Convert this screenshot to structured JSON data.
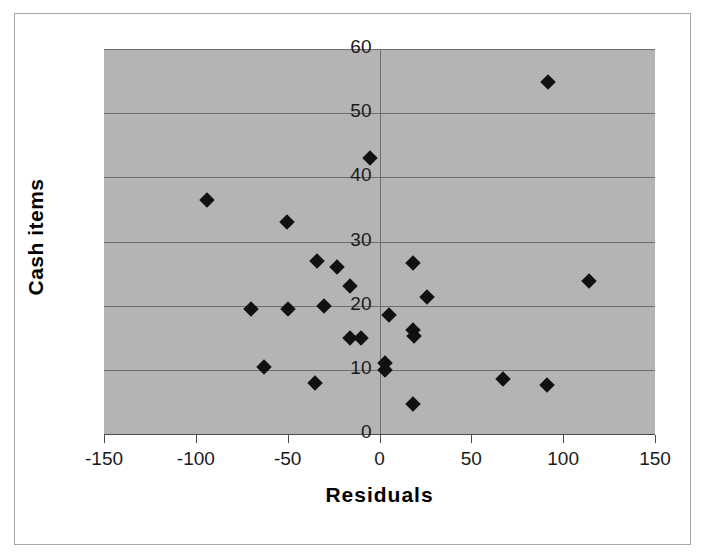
{
  "chart_data": {
    "type": "scatter",
    "title": "",
    "xlabel": "Residuals",
    "ylabel": "Cash items",
    "xlim": [
      -150,
      150
    ],
    "ylim": [
      0,
      60
    ],
    "xticks": [
      -150,
      -100,
      -50,
      0,
      50,
      100,
      150
    ],
    "yticks": [
      0,
      10,
      20,
      30,
      40,
      50,
      60
    ],
    "xtick_labels": [
      "-150",
      "-100",
      "-50",
      "0",
      "50",
      "100",
      "150"
    ],
    "ytick_labels": [
      "0",
      "10",
      "20",
      "30",
      "40",
      "50",
      "60"
    ],
    "grid": "horizontal-and-zero-vertical",
    "legend": "none",
    "plot_background": "#b4b4b4",
    "marker_color": "#111111",
    "marker_shape": "diamond",
    "series": [
      {
        "name": "Cash items vs Residuals",
        "points": [
          {
            "x": -94,
            "y": 36.4
          },
          {
            "x": -70,
            "y": 19.5
          },
          {
            "x": -63,
            "y": 10.5
          },
          {
            "x": -50.5,
            "y": 33.0
          },
          {
            "x": -50,
            "y": 19.5
          },
          {
            "x": -35,
            "y": 8.0
          },
          {
            "x": -34,
            "y": 27.0
          },
          {
            "x": -30,
            "y": 20.0
          },
          {
            "x": -23,
            "y": 26.0
          },
          {
            "x": -16,
            "y": 23.0
          },
          {
            "x": -16,
            "y": 15.0
          },
          {
            "x": -10,
            "y": 15.0
          },
          {
            "x": -5,
            "y": 43.0
          },
          {
            "x": 3,
            "y": 11.0
          },
          {
            "x": 3,
            "y": 10.0
          },
          {
            "x": 5,
            "y": 18.5
          },
          {
            "x": 18,
            "y": 26.6
          },
          {
            "x": 18,
            "y": 16.2
          },
          {
            "x": 19,
            "y": 15.3
          },
          {
            "x": 18,
            "y": 4.7
          },
          {
            "x": 26,
            "y": 21.3
          },
          {
            "x": 67,
            "y": 8.5
          },
          {
            "x": 91,
            "y": 7.6
          },
          {
            "x": 92,
            "y": 54.8
          },
          {
            "x": 114,
            "y": 23.8
          }
        ]
      }
    ]
  }
}
